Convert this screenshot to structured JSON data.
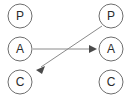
{
  "diagram": {
    "background_color": "#ffffff",
    "node_stroke_color": "#6e6e6e",
    "node_fill_color": "#ffffff",
    "label_color": "#2b2b2b",
    "edge_color": "#8a8a8a",
    "arrowhead_color": "#4a4a4a",
    "nodes": [
      {
        "id": "left-p",
        "label": "P",
        "cx": 20,
        "cy": 16,
        "r": 12,
        "column": "left",
        "row": "top"
      },
      {
        "id": "left-a",
        "label": "A",
        "cx": 20,
        "cy": 49,
        "r": 12,
        "column": "left",
        "row": "middle"
      },
      {
        "id": "left-c",
        "label": "C",
        "cx": 20,
        "cy": 82,
        "r": 12,
        "column": "left",
        "row": "bottom"
      },
      {
        "id": "right-p",
        "label": "P",
        "cx": 111,
        "cy": 16,
        "r": 12,
        "column": "right",
        "row": "top"
      },
      {
        "id": "right-a",
        "label": "A",
        "cx": 111,
        "cy": 49,
        "r": 12,
        "column": "right",
        "row": "middle"
      },
      {
        "id": "right-c",
        "label": "C",
        "cx": 111,
        "cy": 82,
        "r": 12,
        "column": "right",
        "row": "bottom"
      }
    ],
    "edges": [
      {
        "id": "edge-left-a-to-right-a",
        "from": "left-a",
        "to": "right-a",
        "x1": 33,
        "y1": 49,
        "x2": 97,
        "y2": 49,
        "direction": "horizontal-right",
        "arrowhead": "end"
      },
      {
        "id": "edge-right-p-to-left-c",
        "from": "right-p",
        "to": "left-c",
        "x1": 102,
        "y1": 26,
        "x2": 36,
        "y2": 70,
        "direction": "diagonal-down-left",
        "arrowhead": "end"
      }
    ]
  }
}
